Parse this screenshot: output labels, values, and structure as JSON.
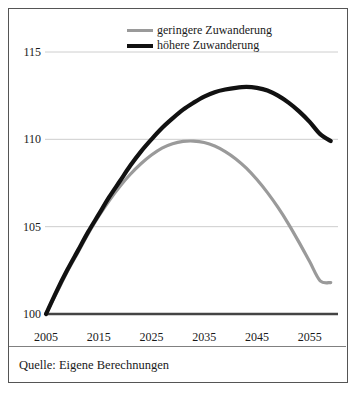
{
  "figure": {
    "source_note": "Quelle: Eigene Berechnungen"
  },
  "chart_data": {
    "type": "line",
    "title": "",
    "xlabel": "",
    "ylabel": "",
    "xlim": [
      2005,
      2060
    ],
    "ylim": [
      100,
      116.5
    ],
    "grid": true,
    "grid_axis": "y",
    "legend_position": "top-center",
    "xticks": [
      2005,
      2015,
      2025,
      2035,
      2045,
      2055
    ],
    "xticklabels": [
      "2005",
      "2015",
      "2025",
      "2035",
      "2045",
      "2055"
    ],
    "yticks": [
      100,
      105,
      110,
      115
    ],
    "yticklabels": [
      "100",
      "105",
      "110",
      "115"
    ],
    "series": [
      {
        "name": "geringere Zuwanderung",
        "color": "#9a9a9a",
        "width": 3.2,
        "x": [
          2005,
          2007,
          2009,
          2011,
          2013,
          2015,
          2017,
          2019,
          2021,
          2023,
          2025,
          2027,
          2029,
          2031,
          2033,
          2035,
          2037,
          2039,
          2041,
          2043,
          2045,
          2047,
          2049,
          2051,
          2053,
          2055,
          2057,
          2059
        ],
        "values": [
          100.0,
          101.2,
          102.4,
          103.5,
          104.6,
          105.6,
          106.5,
          107.3,
          108.0,
          108.6,
          109.1,
          109.5,
          109.75,
          109.88,
          109.9,
          109.82,
          109.62,
          109.3,
          108.88,
          108.35,
          107.7,
          106.95,
          106.1,
          105.15,
          104.1,
          103.0,
          101.9,
          101.8
        ]
      },
      {
        "name": "höhere Zuwanderung",
        "color": "#111111",
        "width": 4.2,
        "x": [
          2005,
          2007,
          2009,
          2011,
          2013,
          2015,
          2017,
          2019,
          2021,
          2023,
          2025,
          2027,
          2029,
          2031,
          2033,
          2035,
          2037,
          2039,
          2041,
          2043,
          2045,
          2047,
          2049,
          2051,
          2053,
          2055,
          2057,
          2059
        ],
        "values": [
          100.0,
          101.3,
          102.5,
          103.6,
          104.7,
          105.7,
          106.7,
          107.6,
          108.5,
          109.3,
          110.0,
          110.65,
          111.2,
          111.7,
          112.1,
          112.45,
          112.7,
          112.85,
          112.95,
          113.0,
          112.95,
          112.8,
          112.5,
          112.1,
          111.6,
          111.0,
          110.3,
          109.9
        ]
      }
    ],
    "baseline": {
      "name": "axis-baseline",
      "value": 100,
      "color": "#444444"
    }
  }
}
